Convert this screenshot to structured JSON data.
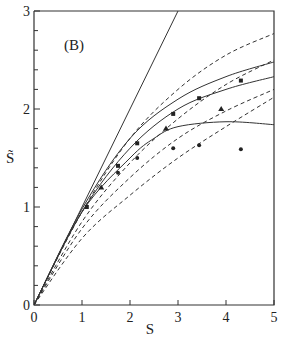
{
  "chart_data": {
    "type": "line",
    "title": "",
    "panel_label": "(B)",
    "xlabel": "S",
    "ylabel": "S̃",
    "xlim": [
      0,
      5
    ],
    "ylim": [
      0,
      3
    ],
    "x_ticks": [
      "0",
      "1",
      "2",
      "3",
      "4",
      "5"
    ],
    "y_ticks": [
      "0",
      "1",
      "2",
      "3"
    ],
    "grid": false,
    "legend": null,
    "series": [
      {
        "name": "identity line S̃ = S",
        "style": "solid",
        "x": [
          0,
          3
        ],
        "y": [
          0,
          3
        ]
      },
      {
        "name": "solid curve upper",
        "style": "solid",
        "x": [
          0,
          1,
          2,
          3,
          4,
          5
        ],
        "y": [
          0,
          0.98,
          1.7,
          2.1,
          2.33,
          2.48
        ]
      },
      {
        "name": "solid curve middle",
        "style": "solid",
        "x": [
          0,
          1,
          2,
          3,
          4,
          5
        ],
        "y": [
          0,
          0.95,
          1.6,
          2.0,
          2.2,
          2.33
        ]
      },
      {
        "name": "solid curve lower (saturating)",
        "style": "solid",
        "x": [
          0,
          1,
          2,
          2.5,
          3,
          4,
          5
        ],
        "y": [
          0,
          0.95,
          1.5,
          1.7,
          1.82,
          1.87,
          1.84
        ]
      },
      {
        "name": "dashed curve 1",
        "style": "dashed",
        "x": [
          0,
          1,
          2,
          3,
          4,
          5
        ],
        "y": [
          0,
          0.95,
          1.7,
          2.2,
          2.55,
          2.77
        ]
      },
      {
        "name": "dashed curve 2",
        "style": "dashed",
        "x": [
          0,
          1,
          2,
          3,
          4,
          5
        ],
        "y": [
          0,
          0.85,
          1.45,
          1.9,
          2.25,
          2.5
        ]
      },
      {
        "name": "dashed curve 3",
        "style": "dashed",
        "x": [
          0,
          1,
          2,
          3,
          4,
          5
        ],
        "y": [
          0,
          0.78,
          1.3,
          1.7,
          1.98,
          2.2
        ]
      },
      {
        "name": "dashed curve 4",
        "style": "dashed",
        "x": [
          0,
          1,
          2,
          3,
          4,
          5
        ],
        "y": [
          0,
          0.68,
          1.12,
          1.5,
          1.82,
          2.12
        ]
      }
    ],
    "markers": [
      {
        "name": "squares",
        "shape": "square",
        "x": [
          1.1,
          1.75,
          2.15,
          2.9,
          3.44,
          4.31
        ],
        "y": [
          1.0,
          1.42,
          1.65,
          1.95,
          2.11,
          2.29
        ]
      },
      {
        "name": "triangles",
        "shape": "triangle",
        "x": [
          1.4,
          2.75,
          3.9
        ],
        "y": [
          1.2,
          1.8,
          2.0
        ]
      },
      {
        "name": "circles",
        "shape": "circle",
        "x": [
          1.75,
          2.15,
          2.9,
          3.44,
          4.31
        ],
        "y": [
          1.35,
          1.5,
          1.6,
          1.63,
          1.59
        ]
      }
    ]
  }
}
